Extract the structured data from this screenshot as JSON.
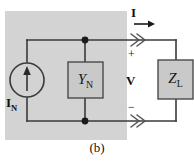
{
  "figure": {
    "caption": "(b)",
    "title_alt": "Norton equivalent circuit with load"
  },
  "colors": {
    "shaded_region_fill": "#d3d3d3",
    "component_box_fill": "#c9c9c9",
    "component_box_border": "#4a4a4a",
    "wire": "#3a3a3a",
    "node_dot": "#1a1a1a",
    "text": "#111111",
    "page_background": "#ffffff"
  },
  "labels": {
    "source_current": {
      "base": "I",
      "sub": "N"
    },
    "line_current": {
      "base": "I",
      "sub": ""
    },
    "terminal_voltage": {
      "base": "V",
      "sub": ""
    },
    "polarity_plus": "+",
    "polarity_minus": "−"
  },
  "components": {
    "admittance": {
      "base": "Y",
      "sub": "N"
    },
    "load_impedance": {
      "base": "Z",
      "sub": "L"
    }
  },
  "elements": {
    "current_source_name": "independent-current-source",
    "shaded_region_name": "norton-source-network-region",
    "top_wire_name": "top-terminal-wire",
    "bottom_wire_name": "bottom-terminal-wire",
    "flow_arrow_name": "current-flow-arrow"
  }
}
